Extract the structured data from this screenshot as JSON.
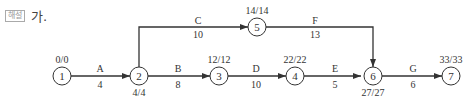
{
  "header": {
    "tag": "해설",
    "text": "가."
  },
  "nodes": [
    {
      "id": "1",
      "label": "1",
      "time": "0/0"
    },
    {
      "id": "2",
      "label": "2",
      "time": "4/4"
    },
    {
      "id": "3",
      "label": "3",
      "time": "12/12"
    },
    {
      "id": "4",
      "label": "4",
      "time": "22/22"
    },
    {
      "id": "5",
      "label": "5",
      "time": "14/14"
    },
    {
      "id": "6",
      "label": "6",
      "time": "27/27"
    },
    {
      "id": "7",
      "label": "7",
      "time": "33/33"
    }
  ],
  "activities": [
    {
      "name": "A",
      "duration": "4",
      "from": "1",
      "to": "2"
    },
    {
      "name": "B",
      "duration": "8",
      "from": "2",
      "to": "3"
    },
    {
      "name": "C",
      "duration": "10",
      "from": "2",
      "to": "5"
    },
    {
      "name": "D",
      "duration": "10",
      "from": "3",
      "to": "4"
    },
    {
      "name": "E",
      "duration": "5",
      "from": "4",
      "to": "6"
    },
    {
      "name": "F",
      "duration": "13",
      "from": "5",
      "to": "6"
    },
    {
      "name": "G",
      "duration": "6",
      "from": "6",
      "to": "7"
    }
  ]
}
